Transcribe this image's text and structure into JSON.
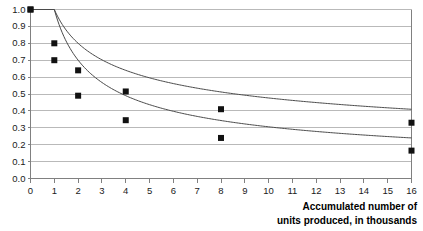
{
  "chart_data": {
    "type": "line",
    "title": "",
    "subtitle": "",
    "xlabel": "Accumulated number of units produced, in thousands",
    "ylabel": "",
    "xlim": [
      0,
      16
    ],
    "ylim": [
      0.0,
      1.0
    ],
    "grid": true,
    "grid_axis": "y",
    "legend": null,
    "legend_position": "none",
    "x_ticks": [
      0,
      1,
      2,
      3,
      4,
      5,
      6,
      7,
      8,
      9,
      10,
      11,
      12,
      13,
      14,
      15,
      16
    ],
    "x_tick_labels": [
      "0",
      "1",
      "2",
      "3",
      "4",
      "5",
      "6",
      "7",
      "8",
      "9",
      "10",
      "11",
      "12",
      "13",
      "14",
      "15",
      "16"
    ],
    "y_ticks": [
      0.0,
      0.1,
      0.2,
      0.3,
      0.4,
      0.5,
      0.6,
      0.7,
      0.8,
      0.9,
      1.0
    ],
    "y_tick_labels": [
      "0.0",
      "0.1",
      "0.2",
      "0.3",
      "0.4",
      "0.5",
      "0.6",
      "0.7",
      "0.8",
      "0.9",
      "1.0"
    ],
    "marker_x": [
      0,
      1,
      2,
      4,
      8,
      16
    ],
    "series": [
      {
        "name": "80% learning curve",
        "color": "#000000",
        "marker": "square",
        "rate": 0.8,
        "x": [
          0,
          1,
          2,
          4,
          8,
          16
        ],
        "values": [
          1.0,
          0.8,
          0.64,
          0.515,
          0.41,
          0.33
        ]
      },
      {
        "name": "70% learning curve",
        "color": "#000000",
        "marker": "square",
        "rate": 0.7,
        "x": [
          0,
          1,
          2,
          4,
          8,
          16
        ],
        "values": [
          1.0,
          0.7,
          0.49,
          0.345,
          0.24,
          0.165
        ]
      }
    ],
    "colors": {
      "gridline": "#b9b9b9",
      "axis": "#808080",
      "curve": "#4a4a4a",
      "marker": "#111111",
      "text": "#1a1a1a",
      "background": "#ffffff"
    }
  },
  "caption": {
    "line1": "Accumulated number of",
    "line2": "units produced, in thousands"
  }
}
